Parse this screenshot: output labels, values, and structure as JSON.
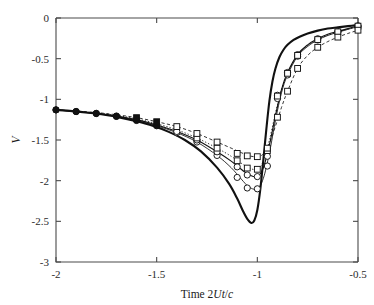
{
  "figure": {
    "background": "#ffffff",
    "ink_color": "#111111",
    "axis_color": "#4a4a4a"
  },
  "axes": {
    "x": {
      "title_prefix": "Time 2",
      "title_italic_1": "Ut",
      "title_slash": "/",
      "title_italic_2": "c",
      "title_full": "Time 2Ut/c",
      "ticks": [
        "-2",
        "-1.5",
        "-1",
        "-0.5"
      ],
      "tick_values": [
        -2,
        -1.5,
        -1,
        -0.5
      ],
      "min": -2,
      "max": -0.5
    },
    "y": {
      "title_full": "V",
      "ticks": [
        "0",
        "-0.5",
        "-1",
        "-1.5",
        "-2",
        "-2.5",
        "-3"
      ],
      "tick_values": [
        0,
        -0.5,
        -1,
        -1.5,
        -2,
        -2.5,
        -3
      ],
      "min": -3,
      "max": 0
    }
  },
  "chart_data": {
    "type": "line",
    "title": "",
    "xlabel": "Time 2Ut/c",
    "ylabel": "V",
    "xlim": [
      -2,
      -0.5
    ],
    "ylim": [
      -3,
      0
    ],
    "grid": false,
    "legend": "none",
    "xticks": [
      -2,
      -1.5,
      -1,
      -0.5
    ],
    "yticks": [
      0,
      -0.5,
      -1,
      -1.5,
      -2,
      -2.5,
      -3
    ],
    "series": [
      {
        "name": "reference-solid-thick",
        "style": "solid",
        "width": "thick",
        "marker": "none",
        "x": [
          -2.0,
          -1.92,
          -1.84,
          -1.76,
          -1.68,
          -1.6,
          -1.52,
          -1.44,
          -1.36,
          -1.28,
          -1.2,
          -1.14,
          -1.1,
          -1.07,
          -1.05,
          -1.03,
          -1.015,
          -1.0,
          -0.985,
          -0.97,
          -0.955,
          -0.94,
          -0.925,
          -0.91,
          -0.89,
          -0.87,
          -0.85,
          -0.82,
          -0.79,
          -0.75,
          -0.7,
          -0.65,
          -0.6,
          -0.55,
          -0.5
        ],
        "y": [
          -1.13,
          -1.145,
          -1.165,
          -1.19,
          -1.225,
          -1.27,
          -1.325,
          -1.4,
          -1.5,
          -1.64,
          -1.84,
          -2.04,
          -2.22,
          -2.38,
          -2.47,
          -2.52,
          -2.49,
          -2.36,
          -2.1,
          -1.74,
          -1.36,
          -1.02,
          -0.78,
          -0.62,
          -0.48,
          -0.39,
          -0.33,
          -0.27,
          -0.23,
          -0.19,
          -0.155,
          -0.13,
          -0.115,
          -0.1,
          -0.085
        ]
      },
      {
        "name": "curve-circle-lower-solid",
        "style": "solid",
        "width": "thin",
        "marker": "circle",
        "x": [
          -2.0,
          -1.9,
          -1.8,
          -1.7,
          -1.6,
          -1.5,
          -1.4,
          -1.3,
          -1.2,
          -1.13,
          -1.08,
          -1.04,
          -1.0,
          -0.97,
          -0.94,
          -0.91,
          -0.88,
          -0.85,
          -0.8,
          -0.75,
          -0.7,
          -0.65,
          -0.6,
          -0.55,
          -0.5
        ],
        "y": [
          -1.13,
          -1.15,
          -1.175,
          -1.21,
          -1.26,
          -1.325,
          -1.41,
          -1.525,
          -1.69,
          -1.84,
          -1.98,
          -2.08,
          -2.1,
          -1.97,
          -1.66,
          -1.26,
          -0.92,
          -0.7,
          -0.47,
          -0.35,
          -0.27,
          -0.215,
          -0.175,
          -0.14,
          -0.105
        ],
        "marker_x": [
          -2.0,
          -1.9,
          -1.8,
          -1.7,
          -1.6,
          -1.5,
          -1.4,
          -1.3,
          -1.2,
          -1.1,
          -1.05,
          -1.0,
          -0.95,
          -0.9,
          -0.85,
          -0.8,
          -0.7,
          -0.6,
          -0.5
        ],
        "marker_y": [
          -1.13,
          -1.15,
          -1.175,
          -1.21,
          -1.26,
          -1.325,
          -1.41,
          -1.525,
          -1.69,
          -1.96,
          -2.09,
          -2.1,
          -1.82,
          -0.99,
          -0.7,
          -0.47,
          -0.27,
          -0.175,
          -0.105
        ]
      },
      {
        "name": "curve-circle-upper-solid",
        "style": "solid",
        "width": "med",
        "marker": "circle",
        "x": [
          -2.0,
          -1.9,
          -1.8,
          -1.7,
          -1.6,
          -1.5,
          -1.4,
          -1.3,
          -1.2,
          -1.13,
          -1.08,
          -1.04,
          -1.0,
          -0.97,
          -0.94,
          -0.91,
          -0.88,
          -0.85,
          -0.8,
          -0.75,
          -0.7,
          -0.65,
          -0.6,
          -0.55,
          -0.5
        ],
        "y": [
          -1.13,
          -1.15,
          -1.172,
          -1.205,
          -1.25,
          -1.315,
          -1.395,
          -1.5,
          -1.645,
          -1.76,
          -1.86,
          -1.93,
          -1.95,
          -1.84,
          -1.56,
          -1.2,
          -0.88,
          -0.67,
          -0.45,
          -0.33,
          -0.255,
          -0.2,
          -0.165,
          -0.13,
          -0.095
        ],
        "marker_x": [
          -2.0,
          -1.9,
          -1.8,
          -1.7,
          -1.6,
          -1.5,
          -1.4,
          -1.3,
          -1.2,
          -1.1,
          -1.05,
          -1.0,
          -0.95,
          -0.9,
          -0.85,
          -0.8,
          -0.7,
          -0.6,
          -0.5
        ],
        "marker_y": [
          -1.13,
          -1.15,
          -1.172,
          -1.205,
          -1.25,
          -1.315,
          -1.395,
          -1.5,
          -1.645,
          -1.83,
          -1.93,
          -1.95,
          -1.7,
          -0.95,
          -0.67,
          -0.45,
          -0.255,
          -0.165,
          -0.095
        ]
      },
      {
        "name": "curve-square-mid-dotted",
        "style": "dotted",
        "width": "thin",
        "marker": "square",
        "x": [
          -2.0,
          -1.9,
          -1.8,
          -1.7,
          -1.6,
          -1.5,
          -1.4,
          -1.3,
          -1.2,
          -1.13,
          -1.08,
          -1.04,
          -1.0,
          -0.97,
          -0.94,
          -0.91,
          -0.88,
          -0.85,
          -0.8,
          -0.75,
          -0.7,
          -0.65,
          -0.6,
          -0.55,
          -0.5
        ],
        "y": [
          -1.13,
          -1.148,
          -1.168,
          -1.198,
          -1.24,
          -1.3,
          -1.375,
          -1.475,
          -1.6,
          -1.7,
          -1.785,
          -1.845,
          -1.86,
          -1.76,
          -1.5,
          -1.17,
          -0.88,
          -0.68,
          -0.46,
          -0.34,
          -0.265,
          -0.21,
          -0.17,
          -0.135,
          -0.1
        ],
        "marker_x": [
          -1.3,
          -1.2,
          -1.1,
          -1.05,
          -1.0,
          -0.95,
          -0.9,
          -0.85,
          -0.8,
          -0.7,
          -0.6,
          -0.5
        ],
        "marker_y": [
          -1.475,
          -1.6,
          -1.755,
          -1.845,
          -1.86,
          -1.63,
          -0.96,
          -0.68,
          -0.46,
          -0.265,
          -0.17,
          -0.1
        ]
      },
      {
        "name": "curve-square-upper-dashed",
        "style": "dashed",
        "width": "thin",
        "marker": "square",
        "x": [
          -2.0,
          -1.9,
          -1.8,
          -1.7,
          -1.6,
          -1.5,
          -1.4,
          -1.3,
          -1.2,
          -1.13,
          -1.08,
          -1.04,
          -1.0,
          -0.97,
          -0.94,
          -0.91,
          -0.88,
          -0.85,
          -0.8,
          -0.75,
          -0.7,
          -0.65,
          -0.6,
          -0.55,
          -0.5
        ],
        "y": [
          -1.13,
          -1.145,
          -1.162,
          -1.19,
          -1.225,
          -1.275,
          -1.335,
          -1.42,
          -1.525,
          -1.6,
          -1.655,
          -1.695,
          -1.705,
          -1.67,
          -1.54,
          -1.33,
          -1.1,
          -0.9,
          -0.62,
          -0.46,
          -0.36,
          -0.29,
          -0.235,
          -0.19,
          -0.15
        ],
        "marker_x": [
          -1.6,
          -1.5,
          -1.4,
          -1.3,
          -1.2,
          -1.1,
          -1.05,
          -1.0,
          -0.95,
          -0.9,
          -0.85,
          -0.8,
          -0.7,
          -0.6,
          -0.5
        ],
        "marker_y": [
          -1.225,
          -1.275,
          -1.335,
          -1.42,
          -1.525,
          -1.665,
          -1.695,
          -1.705,
          -1.6,
          -1.22,
          -0.9,
          -0.62,
          -0.36,
          -0.235,
          -0.15
        ]
      }
    ]
  }
}
